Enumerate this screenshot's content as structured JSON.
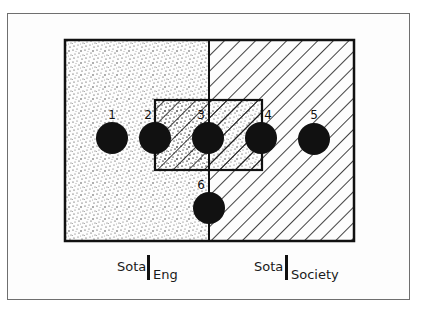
{
  "diagram": {
    "type": "venn-style region diagram",
    "regions": [
      {
        "id": "left",
        "fill": "stipple",
        "label_prefix": "Sota",
        "label_suffix": "Eng"
      },
      {
        "id": "right",
        "fill": "hatch",
        "label_prefix": "Sota",
        "label_suffix": "Society"
      },
      {
        "id": "center",
        "fill": "stipple+hatch"
      }
    ],
    "points": [
      {
        "label": "1",
        "cx": 112,
        "cy": 138
      },
      {
        "label": "2",
        "cx": 155,
        "cy": 138
      },
      {
        "label": "3",
        "cx": 208,
        "cy": 138
      },
      {
        "label": "4",
        "cx": 261,
        "cy": 138
      },
      {
        "label": "5",
        "cx": 314,
        "cy": 139
      },
      {
        "label": "6",
        "cx": 209,
        "cy": 208
      }
    ],
    "colors": {
      "ink": "#111111",
      "paper": "#fdfdfd",
      "frame": "#6f6f6f"
    }
  },
  "labels": {
    "left": {
      "prefix": "Sota",
      "suffix": "Eng"
    },
    "right": {
      "prefix": "Sota",
      "suffix": "Society"
    }
  }
}
